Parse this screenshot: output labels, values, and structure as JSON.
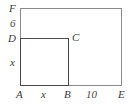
{
  "figure": {
    "type": "geometry-diagram",
    "background_color": "#ffffff",
    "outer_line_color": "#8a8a8a",
    "inner_line_color": "#4a4a4a",
    "text_color": "#3b3b3b"
  },
  "vertices": {
    "A": "A",
    "B": "B",
    "C": "C",
    "D": "D",
    "E": "E",
    "F": "F"
  },
  "measurements": {
    "left_upper": "6",
    "left_lower": "x",
    "bottom_left": "x",
    "bottom_right": "10"
  }
}
